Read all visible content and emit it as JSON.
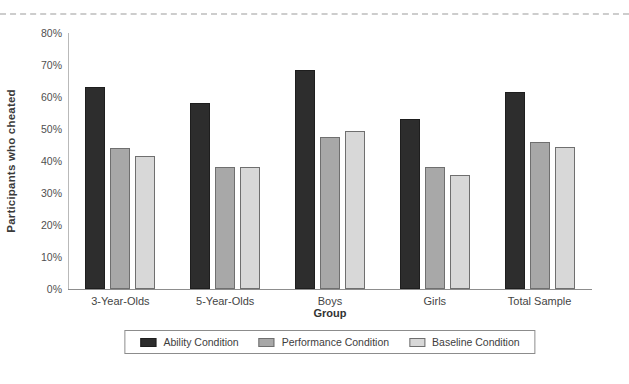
{
  "page": {
    "background_color": "#ffffff",
    "top_divider_color": "#cdcdcd"
  },
  "chart_data": {
    "type": "bar",
    "title": "",
    "xlabel": "Group",
    "ylabel": "Participants who cheated",
    "ylim": [
      0,
      80
    ],
    "ytick_step": 10,
    "ytick_labels": [
      "0%",
      "10%",
      "20%",
      "30%",
      "40%",
      "50%",
      "60%",
      "70%",
      "80%"
    ],
    "grid": false,
    "legend_position": "bottom",
    "categories": [
      "3-Year-Olds",
      "5-Year-Olds",
      "Boys",
      "Girls",
      "Total Sample"
    ],
    "series": [
      {
        "name": "Ability Condition",
        "fill": "#2d2d2d",
        "border": "#1e1e1e",
        "values": [
          63,
          58,
          68.5,
          53,
          61.5
        ]
      },
      {
        "name": "Performance Condition",
        "fill": "#a8a8a8",
        "border": "#6f6f6f",
        "values": [
          44,
          38,
          47.5,
          38,
          46
        ]
      },
      {
        "name": "Baseline Condition",
        "fill": "#d8d8d8",
        "border": "#6f6f6f",
        "values": [
          41.5,
          38,
          49.5,
          35.5,
          44.5
        ]
      }
    ]
  }
}
